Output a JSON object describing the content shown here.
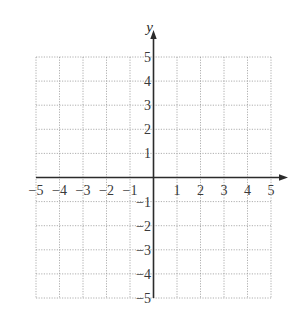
{
  "chart_data": {
    "type": "scatter",
    "title": "",
    "xlabel": "",
    "ylabel": "y",
    "xlim": [
      -5,
      5
    ],
    "ylim": [
      -5,
      5
    ],
    "grid": true,
    "grid_style": "dotted",
    "x_ticks": [
      -5,
      -4,
      -3,
      -2,
      -1,
      1,
      2,
      3,
      4,
      5
    ],
    "y_ticks": [
      -5,
      -4,
      -3,
      -2,
      -1,
      1,
      2,
      3,
      4,
      5
    ],
    "x_tick_labels": [
      "−5",
      "−4",
      "−3",
      "−2",
      "−1",
      "1",
      "2",
      "3",
      "4",
      "5"
    ],
    "y_tick_labels": [
      "−5",
      "−4",
      "−3",
      "−2",
      "−1",
      "1",
      "2",
      "3",
      "4",
      "5"
    ],
    "series": [],
    "legend": null,
    "annotations": []
  },
  "colors": {
    "axis": "#2b2b2b",
    "grid": "#9a9a9a",
    "text": "#3a3a3a",
    "background": "#ffffff"
  }
}
